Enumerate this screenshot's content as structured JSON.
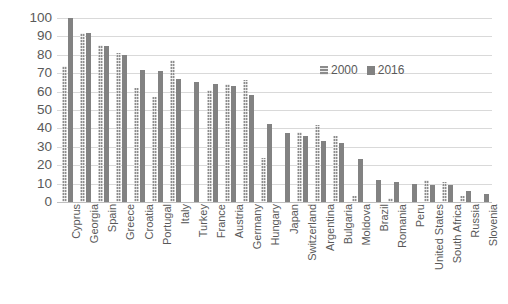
{
  "chart_data": {
    "type": "bar",
    "title": "",
    "xlabel": "",
    "ylabel": "",
    "ylim": [
      0,
      100
    ],
    "ytick_step": 10,
    "yticks": [
      "100",
      "90",
      "80",
      "70",
      "60",
      "50",
      "40",
      "30",
      "20",
      "10",
      "0"
    ],
    "grid": true,
    "legend_position": "inside-upper-right",
    "categories": [
      "Cyprus",
      "Georgia",
      "Spain",
      "Greece",
      "Croatia",
      "Portugal",
      "Italy",
      "Turkey",
      "France",
      "Austria",
      "Germany",
      "Hungary",
      "Japan",
      "Switzerland",
      "Argentina",
      "Bulgaria",
      "Moldova",
      "Brazil",
      "Romania",
      "Peru",
      "United States",
      "South Africa",
      "Russia",
      "Slovenia"
    ],
    "series": [
      {
        "name": "2000",
        "color": "#8c8c8c",
        "pattern": "hatched",
        "values": [
          74,
          92,
          85.5,
          81,
          62,
          57,
          77,
          0,
          61,
          64,
          66.5,
          24,
          0,
          38,
          42,
          36,
          3,
          0,
          2,
          0,
          12,
          11,
          3,
          0
        ]
      },
      {
        "name": "2016",
        "color": "#828282",
        "pattern": "solid",
        "values": [
          100,
          92,
          85,
          80,
          72,
          71,
          67,
          65,
          64,
          63,
          58,
          42.5,
          37.5,
          36,
          33,
          32,
          23.5,
          12,
          11,
          10,
          9.5,
          9.5,
          6,
          4.5
        ]
      }
    ]
  },
  "legend": {
    "items": [
      {
        "label": "2000"
      },
      {
        "label": "2016"
      }
    ]
  },
  "colors": {
    "series_2000": "#8c8c8c",
    "series_2016": "#828282",
    "gridline": "#d9d9d9",
    "text": "#595959",
    "background": "#ffffff"
  }
}
